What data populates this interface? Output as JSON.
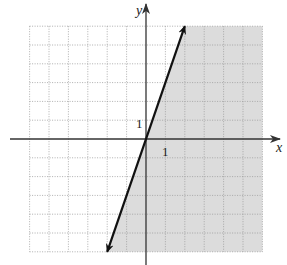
{
  "chart_data": {
    "type": "line",
    "title": "",
    "xlabel": "x",
    "ylabel": "y",
    "xlim": [
      -6,
      6
    ],
    "ylim": [
      -6,
      6
    ],
    "grid": true,
    "grid_style": "dotted",
    "tick_labels": {
      "x": "1",
      "y": "1"
    },
    "boundary_line": {
      "equation": "y = 3x",
      "slope": 3,
      "intercept": 0,
      "style": "solid",
      "arrows": "both",
      "from": [
        -2,
        -6
      ],
      "to": [
        2,
        6
      ]
    },
    "shaded_region": "right of line (y <= 3x)",
    "colors": {
      "shade": "#dcdcdc",
      "grid": "#9a9a9a",
      "line": "#111111",
      "axis": "#333333"
    }
  }
}
